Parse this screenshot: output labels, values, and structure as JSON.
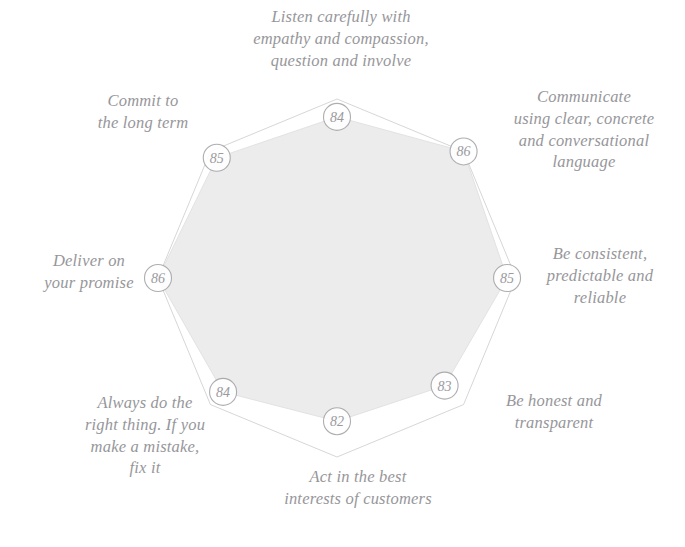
{
  "chart_data": {
    "type": "radar",
    "title": "",
    "categories": [
      "Listen carefully with\nempathy and compassion,\nquestion and involve",
      "Communicate\nusing clear, concrete\nand conversational\nlanguage",
      "Be consistent,\npredictable and\nreliable",
      "Be honest and\ntransparent",
      "Act in the best\ninterests of customers",
      "Always do the\nright thing. If you\nmake a mistake,\nfix it",
      "Deliver on\nyour promise",
      "Commit to\nthe long term"
    ],
    "values": [
      84,
      86,
      85,
      83,
      82,
      84,
      86,
      85
    ],
    "value_labels": [
      "84",
      "86",
      "85",
      "83",
      "82",
      "84",
      "86",
      "85"
    ],
    "rmin": 0,
    "rmax": 100,
    "rings": 3,
    "ring_levels": [
      60,
      73,
      86
    ],
    "grid": true,
    "legend": "none",
    "fill_color": "#ececec",
    "grid_color": "#c9c9cc",
    "marker_fill": "#ffffff",
    "marker_stroke": "#a6a6aa",
    "label_color": "#8e8e92"
  },
  "labels": {
    "top": "Listen carefully with\nempathy and compassion,\nquestion and involve",
    "topright": "Communicate\nusing clear, concrete\nand conversational\nlanguage",
    "right": "Be consistent,\npredictable and\nreliable",
    "botright": "Be honest and\ntransparent",
    "bottom": "Act in the best\ninterests of customers",
    "botleft": "Always do the\nright thing. If you\nmake a mistake,\nfix it",
    "left": "Deliver on\nyour promise",
    "topleft": "Commit to\nthe long term"
  },
  "values": {
    "top": "84",
    "topright": "86",
    "right": "85",
    "botright": "83",
    "bottom": "82",
    "botleft": "84",
    "left": "86",
    "topleft": "85"
  }
}
